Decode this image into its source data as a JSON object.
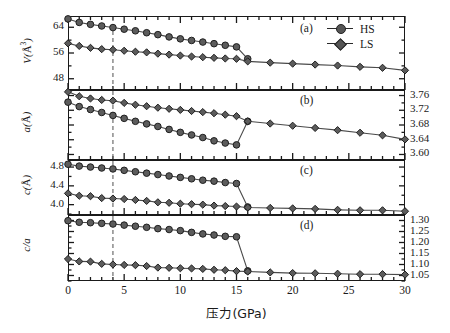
{
  "figure": {
    "xlabel": "压力(GPa)",
    "legend": [
      {
        "label": "HS",
        "marker": "circle"
      },
      {
        "label": "LS",
        "marker": "diamond"
      }
    ],
    "panel_labels": [
      "(a)",
      "(b)",
      "(c)",
      "(d)"
    ],
    "transition_marker_gpa": 4
  },
  "chart_data": [
    {
      "type": "line",
      "panel": "(a)",
      "title": "",
      "xlabel": "压力(GPa)",
      "ylabel": "V(Å³)",
      "xlim": [
        0,
        30
      ],
      "ylim": [
        44.5,
        67.5
      ],
      "xticks": [
        0,
        5,
        10,
        15,
        20,
        25,
        30
      ],
      "yticks": [
        48,
        56,
        64
      ],
      "ytick_labels": [
        "48",
        "56",
        "64"
      ],
      "yaxis_side": "left",
      "grid": false,
      "legend_position": "top-right",
      "vline_x": 4,
      "series": [
        {
          "name": "HS",
          "marker": "circle",
          "x": [
            0,
            1,
            2,
            3,
            4,
            5,
            6,
            7,
            8,
            9,
            10,
            11,
            12,
            13,
            14,
            15,
            16
          ],
          "values": [
            66.6,
            65.5,
            64.9,
            64.4,
            63.9,
            63.4,
            62.9,
            62.3,
            61.7,
            61.0,
            60.4,
            59.9,
            59.4,
            58.9,
            58.4,
            57.9,
            54.2
          ]
        },
        {
          "name": "LS",
          "marker": "diamond",
          "x": [
            0,
            1,
            2,
            3,
            4,
            5,
            6,
            7,
            8,
            9,
            10,
            11,
            12,
            13,
            14,
            15,
            16,
            18,
            20,
            22,
            24,
            26,
            28,
            30
          ],
          "values": [
            59.0,
            58.2,
            57.6,
            57.2,
            57.0,
            56.7,
            56.4,
            56.2,
            55.8,
            55.5,
            55.2,
            54.9,
            54.7,
            54.5,
            54.3,
            54.2,
            53.4,
            53.0,
            52.7,
            52.4,
            52.1,
            51.7,
            51.4,
            50.6
          ]
        }
      ]
    },
    {
      "type": "line",
      "panel": "(b)",
      "title": "",
      "xlabel": "压力(GPa)",
      "ylabel": "a(Å)",
      "xlim": [
        0,
        30
      ],
      "ylim": [
        3.585,
        3.775
      ],
      "xticks": [
        0,
        5,
        10,
        15,
        20,
        25,
        30
      ],
      "yticks": [
        3.6,
        3.64,
        3.68,
        3.72,
        3.76
      ],
      "ytick_labels": [
        "3.60",
        "3.64",
        "3.68",
        "3.72",
        "3.76"
      ],
      "yaxis_side": "right",
      "grid": false,
      "vline_x": 4,
      "series": [
        {
          "name": "HS",
          "marker": "circle",
          "x": [
            0,
            1,
            2,
            3,
            4,
            5,
            6,
            7,
            8,
            9,
            10,
            11,
            12,
            13,
            14,
            15,
            16
          ],
          "values": [
            3.742,
            3.73,
            3.722,
            3.714,
            3.706,
            3.698,
            3.69,
            3.683,
            3.676,
            3.668,
            3.66,
            3.653,
            3.646,
            3.637,
            3.631,
            3.626,
            3.69
          ]
        },
        {
          "name": "LS",
          "marker": "diamond",
          "x": [
            0,
            1,
            2,
            3,
            4,
            5,
            6,
            7,
            8,
            9,
            10,
            11,
            12,
            13,
            14,
            15,
            16,
            18,
            20,
            22,
            24,
            26,
            28,
            30
          ],
          "values": [
            3.77,
            3.758,
            3.752,
            3.748,
            3.746,
            3.74,
            3.735,
            3.731,
            3.727,
            3.724,
            3.721,
            3.718,
            3.715,
            3.712,
            3.708,
            3.704,
            3.69,
            3.684,
            3.678,
            3.672,
            3.666,
            3.659,
            3.652,
            3.641
          ]
        }
      ]
    },
    {
      "type": "line",
      "panel": "(c)",
      "title": "",
      "xlabel": "压力(GPa)",
      "ylabel": "c(Å)",
      "xlim": [
        0,
        30
      ],
      "ylim": [
        3.78,
        4.95
      ],
      "xticks": [
        0,
        5,
        10,
        15,
        20,
        25,
        30
      ],
      "yticks": [
        4.0,
        4.4,
        4.8
      ],
      "ytick_labels": [
        "4.0",
        "4.4",
        "4.8"
      ],
      "yaxis_side": "left",
      "grid": false,
      "vline_x": 4,
      "series": [
        {
          "name": "HS",
          "marker": "circle",
          "x": [
            0,
            1,
            2,
            3,
            4,
            5,
            6,
            7,
            8,
            9,
            10,
            11,
            12,
            13,
            14,
            15,
            16
          ],
          "values": [
            4.86,
            4.82,
            4.8,
            4.78,
            4.76,
            4.73,
            4.7,
            4.67,
            4.64,
            4.61,
            4.58,
            4.55,
            4.52,
            4.5,
            4.47,
            4.45,
            3.95
          ]
        },
        {
          "name": "LS",
          "marker": "diamond",
          "x": [
            0,
            1,
            2,
            3,
            4,
            5,
            6,
            7,
            8,
            9,
            10,
            11,
            12,
            13,
            14,
            15,
            16,
            18,
            20,
            22,
            24,
            26,
            28,
            30
          ],
          "values": [
            4.24,
            4.19,
            4.18,
            4.14,
            4.13,
            4.12,
            4.1,
            4.08,
            4.05,
            4.04,
            4.02,
            4.01,
            4.0,
            3.98,
            3.97,
            3.96,
            3.94,
            3.93,
            3.92,
            3.91,
            3.89,
            3.88,
            3.88,
            3.86
          ]
        }
      ]
    },
    {
      "type": "line",
      "panel": "(d)",
      "title": "",
      "xlabel": "压力(GPa)",
      "ylabel": "c/a",
      "xlim": [
        0,
        30
      ],
      "ylim": [
        1.025,
        1.325
      ],
      "xticks": [
        0,
        5,
        10,
        15,
        20,
        25,
        30
      ],
      "yticks": [
        1.05,
        1.1,
        1.15,
        1.2,
        1.25,
        1.3
      ],
      "ytick_labels": [
        "1.05",
        "1.10",
        "1.15",
        "1.20",
        "1.25",
        "1.30"
      ],
      "yaxis_side": "right",
      "grid": false,
      "vline_x": 4,
      "series": [
        {
          "name": "HS",
          "marker": "circle",
          "x": [
            0,
            1,
            2,
            3,
            4,
            5,
            6,
            7,
            8,
            9,
            10,
            11,
            12,
            13,
            14,
            15,
            16
          ],
          "values": [
            1.299,
            1.292,
            1.29,
            1.287,
            1.284,
            1.279,
            1.274,
            1.269,
            1.263,
            1.259,
            1.254,
            1.246,
            1.239,
            1.234,
            1.228,
            1.226,
            1.071
          ]
        },
        {
          "name": "LS",
          "marker": "diamond",
          "x": [
            0,
            1,
            2,
            3,
            4,
            5,
            6,
            7,
            8,
            9,
            10,
            11,
            12,
            13,
            14,
            15,
            16,
            18,
            20,
            22,
            24,
            26,
            28,
            30
          ],
          "values": [
            1.125,
            1.114,
            1.113,
            1.103,
            1.1,
            1.098,
            1.097,
            1.093,
            1.086,
            1.085,
            1.083,
            1.082,
            1.08,
            1.076,
            1.074,
            1.07,
            1.068,
            1.064,
            1.061,
            1.06,
            1.058,
            1.056,
            1.056,
            1.054
          ]
        }
      ]
    }
  ]
}
